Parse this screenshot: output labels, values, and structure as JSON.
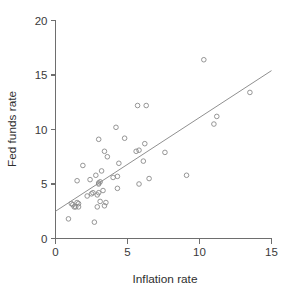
{
  "chart_data": {
    "type": "scatter",
    "title": "",
    "xlabel": "Inflation rate",
    "ylabel": "Fed funds rate",
    "xlim": [
      0,
      15
    ],
    "ylim": [
      0,
      20
    ],
    "xticks": [
      "0",
      "5",
      "10",
      "15"
    ],
    "xtick_values": [
      0,
      5,
      10,
      15
    ],
    "yticks": [
      "0",
      "5",
      "10",
      "15",
      "20"
    ],
    "ytick_values": [
      0,
      5,
      10,
      15,
      20
    ],
    "grid": false,
    "legend": "none",
    "marker": "open-circle",
    "point_color": "#8a8a8a",
    "line_color": "#909090",
    "axis_color": "#6e6e6e",
    "series": [
      {
        "name": "Fed funds rate vs Inflation rate",
        "x": [
          0.9,
          1.1,
          1.2,
          1.3,
          1.4,
          1.5,
          1.5,
          1.6,
          1.6,
          1.9,
          2.2,
          2.4,
          2.5,
          2.6,
          2.7,
          2.8,
          2.9,
          2.9,
          3.0,
          3.0,
          3.0,
          3.0,
          3.1,
          3.1,
          3.2,
          3.3,
          3.4,
          3.4,
          3.5,
          3.6,
          4.0,
          4.2,
          4.3,
          4.3,
          4.4,
          4.8,
          5.6,
          5.7,
          5.8,
          5.8,
          6.1,
          6.2,
          6.3,
          6.5,
          7.6,
          9.1,
          10.3,
          11.0,
          11.2,
          13.5
        ],
        "y": [
          1.8,
          3.2,
          3.1,
          2.9,
          2.9,
          5.3,
          3.3,
          2.9,
          3.2,
          6.7,
          3.9,
          5.4,
          4.1,
          4.2,
          1.5,
          5.8,
          4.0,
          2.9,
          9.1,
          5.1,
          5.0,
          4.2,
          3.4,
          5.2,
          6.2,
          4.4,
          8.0,
          3.0,
          3.3,
          7.5,
          5.6,
          10.2,
          5.7,
          4.6,
          6.9,
          9.2,
          8.0,
          12.2,
          5.0,
          8.1,
          7.1,
          8.7,
          12.2,
          5.5,
          7.9,
          5.8,
          16.4,
          10.5,
          11.2,
          13.4
        ]
      }
    ],
    "trend_line": {
      "type": "linear-fit",
      "x_start": 0,
      "y_start": 2.5,
      "x_end": 15,
      "y_end": 15.4
    }
  }
}
